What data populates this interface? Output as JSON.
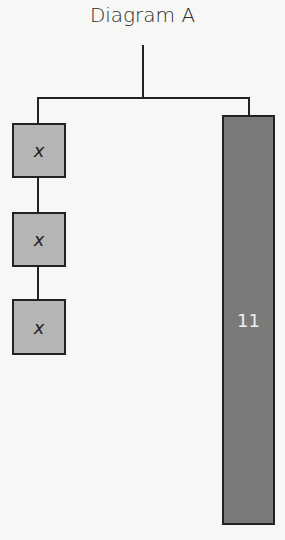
{
  "title": "Diagram A",
  "left_stack": {
    "boxes": [
      {
        "label": "x"
      },
      {
        "label": "x"
      },
      {
        "label": "x"
      }
    ],
    "fill_color": "#b5b5b3"
  },
  "right_bar": {
    "label": "11",
    "fill_color": "#7a7a79"
  }
}
